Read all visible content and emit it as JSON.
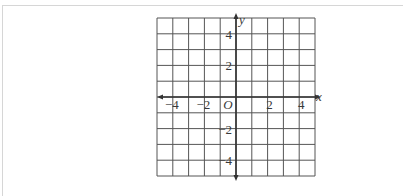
{
  "diagram": {
    "type": "coordinate-grid",
    "x_axis_label": "x",
    "y_axis_label": "y",
    "origin_label": "O",
    "x_range": [
      -5,
      5
    ],
    "y_range": [
      -5,
      5
    ],
    "grid_step": 1,
    "x_tick_labels": [
      {
        "value": -4,
        "text": "−4"
      },
      {
        "value": -2,
        "text": "−2"
      },
      {
        "value": 2,
        "text": "2"
      },
      {
        "value": 4,
        "text": "4"
      }
    ],
    "y_tick_labels": [
      {
        "value": 4,
        "text": "4"
      },
      {
        "value": 2,
        "text": "2"
      },
      {
        "value": -2,
        "text": "−2"
      },
      {
        "value": -4,
        "text": "−4"
      }
    ],
    "colors": {
      "grid": "#555555",
      "axis": "#333333",
      "label": "#3a3a3a",
      "background": "#ffffff"
    }
  }
}
